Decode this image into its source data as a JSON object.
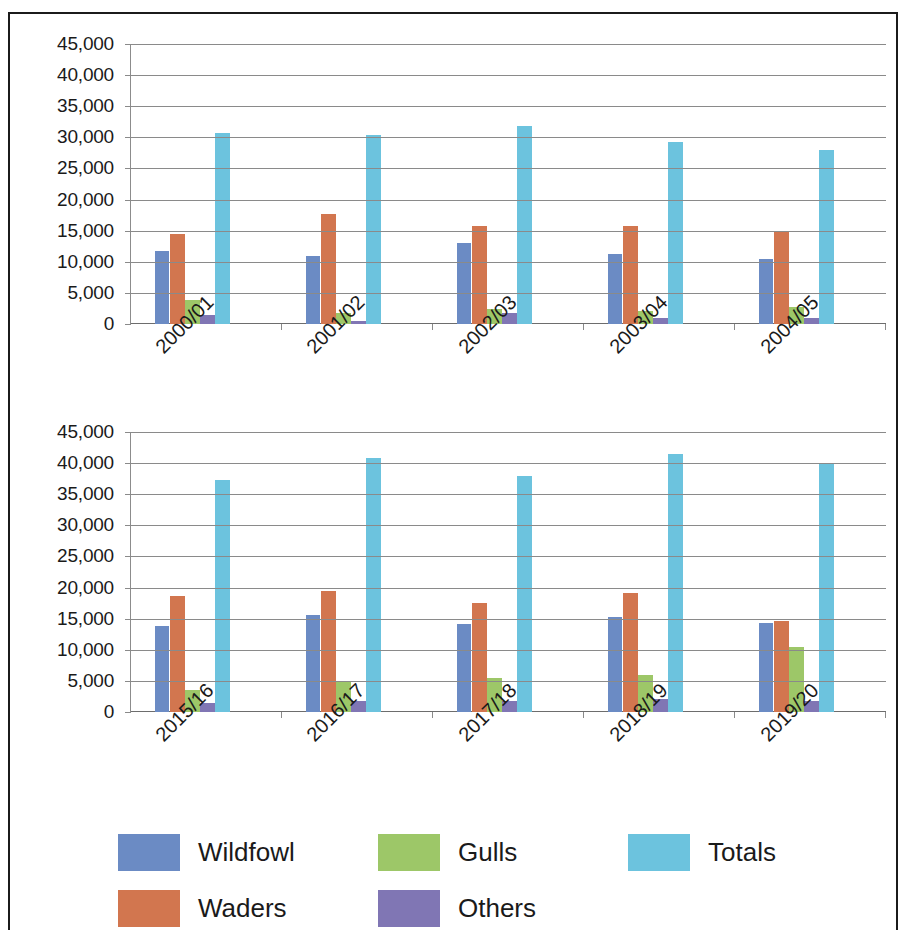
{
  "chart_data": [
    {
      "type": "bar",
      "title": "",
      "xlabel": "",
      "ylabel": "",
      "ylim": [
        0,
        45000
      ],
      "ytick_labels": [
        "45,000",
        "40,000",
        "35,000",
        "30,000",
        "25,000",
        "20,000",
        "15,000",
        "10,000",
        "5,000",
        "0"
      ],
      "ytick_values": [
        45000,
        40000,
        35000,
        30000,
        25000,
        20000,
        15000,
        10000,
        5000,
        0
      ],
      "grid": true,
      "legend_position": "bottom",
      "categories": [
        "2000/01",
        "2001/02",
        "2002/03",
        "2003/04",
        "2004/05"
      ],
      "series": [
        {
          "name": "Wildfowl",
          "color": "#6b8bc4",
          "values": [
            11700,
            10900,
            13000,
            11300,
            10400
          ]
        },
        {
          "name": "Waders",
          "color": "#d2764f",
          "values": [
            14400,
            17700,
            15800,
            15800,
            14800
          ]
        },
        {
          "name": "Gulls",
          "color": "#9dc768",
          "values": [
            3900,
            1700,
            2400,
            2100,
            2800
          ]
        },
        {
          "name": "Others",
          "color": "#8076b4",
          "values": [
            1400,
            500,
            1700,
            1000,
            1000
          ]
        },
        {
          "name": "Totals",
          "color": "#6cc3de",
          "values": [
            30700,
            30400,
            31900,
            29300,
            27900
          ]
        }
      ]
    },
    {
      "type": "bar",
      "title": "",
      "xlabel": "",
      "ylabel": "",
      "ylim": [
        0,
        45000
      ],
      "ytick_labels": [
        "45,000",
        "40,000",
        "35,000",
        "30,000",
        "25,000",
        "20,000",
        "15,000",
        "10,000",
        "5,000",
        "0"
      ],
      "ytick_values": [
        45000,
        40000,
        35000,
        30000,
        25000,
        20000,
        15000,
        10000,
        5000,
        0
      ],
      "grid": true,
      "legend_position": "bottom",
      "categories": [
        "2015/16",
        "2016/17",
        "2017/18",
        "2018/19",
        "2019/20"
      ],
      "series": [
        {
          "name": "Wildfowl",
          "color": "#6b8bc4",
          "values": [
            13800,
            15600,
            14200,
            15200,
            14300
          ]
        },
        {
          "name": "Waders",
          "color": "#d2764f",
          "values": [
            18600,
            19500,
            17600,
            19200,
            14700
          ]
        },
        {
          "name": "Gulls",
          "color": "#9dc768",
          "values": [
            3600,
            4900,
            5400,
            6000,
            10400
          ]
        },
        {
          "name": "Others",
          "color": "#8076b4",
          "values": [
            1500,
            1700,
            1700,
            2100,
            1700
          ]
        },
        {
          "name": "Totals",
          "color": "#6cc3de",
          "values": [
            37300,
            40800,
            37900,
            41400,
            39800
          ]
        }
      ]
    }
  ],
  "legend": {
    "items": [
      {
        "label": "Wildfowl",
        "color": "#6b8bc4"
      },
      {
        "label": "Waders",
        "color": "#d2764f"
      },
      {
        "label": "Gulls",
        "color": "#9dc768"
      },
      {
        "label": "Others",
        "color": "#8076b4"
      },
      {
        "label": "Totals",
        "color": "#6cc3de"
      }
    ]
  },
  "colors": {
    "wildfowl": "#6b8bc4",
    "waders": "#d2764f",
    "gulls": "#9dc768",
    "others": "#8076b4",
    "totals": "#6cc3de",
    "gridline": "#8a8a8a",
    "text": "#1a1a1a",
    "frame": "#1b1b1b"
  }
}
